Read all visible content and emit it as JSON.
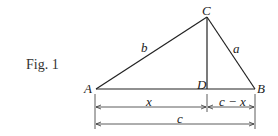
{
  "figure": {
    "caption": "Fig. 1",
    "vertices": {
      "A": "A",
      "B": "B",
      "C": "C",
      "D": "D"
    },
    "sides": {
      "a": "a",
      "b": "b"
    },
    "dimensions": {
      "x": "x",
      "c_minus_x": "c − x",
      "c": "c"
    }
  }
}
